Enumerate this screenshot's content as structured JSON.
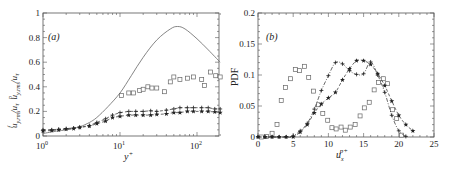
{
  "chart_data": [
    {
      "panel": "(a)",
      "type": "line",
      "xscale": "log",
      "xlabel": "y+",
      "ylabel": "u^f_{y,rms}/u_τ  u^p_{y,rms}/u_τ",
      "xlim": [
        1,
        200
      ],
      "ylim": [
        0,
        1
      ],
      "xticks": [
        "10^0",
        "10^1",
        "10^2"
      ],
      "yticks": [
        "0",
        "0.2",
        "0.4",
        "0.6",
        "0.8",
        "1"
      ],
      "series": [
        {
          "name": "fluid",
          "style": "solid-line",
          "x": [
            1,
            1.5,
            2,
            3,
            4,
            5,
            7,
            10,
            14,
            20,
            30,
            45,
            56,
            70,
            100,
            140,
            200
          ],
          "y": [
            0.02,
            0.04,
            0.05,
            0.075,
            0.11,
            0.15,
            0.24,
            0.35,
            0.49,
            0.64,
            0.78,
            0.87,
            0.89,
            0.87,
            0.79,
            0.7,
            0.6
          ]
        },
        {
          "name": "particles-squares",
          "style": "open-square",
          "x": [
            10.5,
            13,
            15,
            18,
            20,
            23,
            26,
            30,
            38,
            45,
            50,
            60,
            75,
            90,
            115,
            125,
            150,
            175,
            200
          ],
          "y": [
            0.33,
            0.35,
            0.35,
            0.37,
            0.38,
            0.4,
            0.39,
            0.39,
            0.36,
            0.44,
            0.48,
            0.46,
            0.47,
            0.48,
            0.46,
            0.41,
            0.52,
            0.49,
            0.48
          ]
        },
        {
          "name": "particles-plus",
          "style": "plus-dashed",
          "x": [
            1,
            1.3,
            1.6,
            2,
            2.5,
            3,
            4,
            5,
            6.5,
            8,
            10,
            13,
            16,
            20,
            25,
            30,
            40,
            50,
            60,
            75,
            90,
            115,
            140,
            170,
            200
          ],
          "y": [
            0.05,
            0.05,
            0.055,
            0.06,
            0.065,
            0.07,
            0.085,
            0.11,
            0.14,
            0.17,
            0.19,
            0.2,
            0.2,
            0.2,
            0.205,
            0.2,
            0.21,
            0.22,
            0.23,
            0.23,
            0.23,
            0.23,
            0.23,
            0.22,
            0.22
          ]
        },
        {
          "name": "particles-star",
          "style": "filled-star",
          "x": [
            1,
            1.3,
            1.6,
            2,
            2.5,
            3,
            4,
            5,
            6.5,
            8,
            10,
            13,
            16,
            20,
            25,
            30,
            40,
            50,
            60,
            75,
            90,
            115,
            140,
            170,
            200
          ],
          "y": [
            0.04,
            0.045,
            0.05,
            0.055,
            0.06,
            0.07,
            0.08,
            0.1,
            0.12,
            0.15,
            0.16,
            0.17,
            0.17,
            0.17,
            0.17,
            0.175,
            0.18,
            0.19,
            0.19,
            0.2,
            0.2,
            0.2,
            0.2,
            0.195,
            0.19
          ]
        }
      ]
    },
    {
      "panel": "(b)",
      "type": "line",
      "xlabel": "u_x^{p+}",
      "ylabel": "PDF",
      "xlim": [
        0,
        25
      ],
      "ylim": [
        0,
        0.2
      ],
      "xticks": [
        "0",
        "5",
        "10",
        "15",
        "20",
        "25"
      ],
      "yticks": [
        "0",
        "0.05",
        "0.1",
        "0.15",
        "0.2"
      ],
      "series": [
        {
          "name": "squares",
          "style": "open-square",
          "x": [
            0.5,
            1.2,
            2,
            2.7,
            3.3,
            3.9,
            4.6,
            5.3,
            5.9,
            6.6,
            7.2,
            7.9,
            8.6,
            9.2,
            9.9,
            10.5,
            11.1,
            11.8,
            12.4,
            13.1,
            13.8,
            14.5,
            15.1,
            15.8,
            16.5,
            17.1,
            17.8,
            18.4,
            19.1,
            19.7,
            20.4
          ],
          "y": [
            0.0,
            0.001,
            0.006,
            0.02,
            0.059,
            0.08,
            0.094,
            0.109,
            0.107,
            0.114,
            0.096,
            0.074,
            0.052,
            0.038,
            0.027,
            0.015,
            0.013,
            0.016,
            0.011,
            0.016,
            0.02,
            0.034,
            0.047,
            0.056,
            0.076,
            0.088,
            0.094,
            0.086,
            0.044,
            0.03,
            0.003
          ]
        },
        {
          "name": "plus-dashdot",
          "style": "plus-dashdot",
          "x": [
            0,
            1,
            2,
            3,
            4,
            5,
            6,
            7,
            8,
            9,
            10,
            11,
            12,
            13,
            14,
            15,
            16,
            17,
            18,
            19,
            20,
            21
          ],
          "y": [
            0,
            0,
            0,
            0,
            0,
            0.002,
            0.01,
            0.022,
            0.045,
            0.075,
            0.099,
            0.12,
            0.118,
            0.107,
            0.101,
            0.102,
            0.121,
            0.1,
            0.072,
            0.035,
            0.01,
            0.001
          ]
        },
        {
          "name": "star-dashed",
          "style": "filled-star",
          "x": [
            0,
            1,
            2,
            3,
            4,
            5,
            6,
            7,
            8,
            9,
            10,
            11,
            12,
            13,
            14,
            15,
            16,
            17,
            18,
            19,
            20,
            21,
            22
          ],
          "y": [
            0,
            0,
            0,
            0,
            0,
            0,
            0.008,
            0.02,
            0.039,
            0.053,
            0.063,
            0.072,
            0.092,
            0.11,
            0.123,
            0.123,
            0.117,
            0.102,
            0.083,
            0.058,
            0.035,
            0.02,
            0.01
          ]
        }
      ]
    }
  ],
  "panels": {
    "a": {
      "label": "(a)",
      "xlabel": "y",
      "xlabel_sup": "+",
      "ylabel_text": "u",
      "y_ticks": [
        "0",
        "0.2",
        "0.4",
        "0.6",
        "0.8",
        "1"
      ],
      "x_ticks_base": [
        "10",
        "10",
        "10"
      ],
      "x_ticks_exp": [
        "0",
        "1",
        "2"
      ]
    },
    "b": {
      "label": "(b)",
      "ylabel": "PDF",
      "xlabel": "u",
      "xlabel_sub": "x",
      "xlabel_sup": "p+",
      "y_ticks": [
        "0",
        "0.05",
        "0.1",
        "0.15",
        "0.2"
      ],
      "x_ticks": [
        "0",
        "5",
        "10",
        "15",
        "20",
        "25"
      ]
    }
  }
}
